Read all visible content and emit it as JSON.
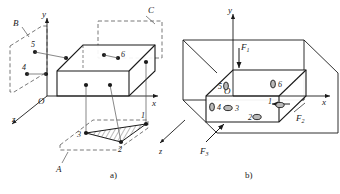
{
  "figure": {
    "caption_a": "a)",
    "caption_b": "b)"
  },
  "panel_a": {
    "name": "Locating scheme with reference planes",
    "axes": {
      "y": "y",
      "x": "x",
      "z": "z",
      "origin": "O"
    },
    "plane_labels": [
      {
        "id": "A",
        "label": "A",
        "note": "bottom dashed plane carrying points 1, 2, 3"
      },
      {
        "id": "B",
        "label": "B",
        "note": "left dashed plane carrying points 4, 5"
      },
      {
        "id": "C",
        "label": "C",
        "note": "rear dashed plane carrying point 6"
      }
    ],
    "points": [
      {
        "id": "1",
        "label": "1"
      },
      {
        "id": "2",
        "label": "2"
      },
      {
        "id": "3",
        "label": "3"
      },
      {
        "id": "4",
        "label": "4"
      },
      {
        "id": "5",
        "label": "5"
      },
      {
        "id": "6",
        "label": "6"
      }
    ]
  },
  "panel_b": {
    "name": "Block with applied forces",
    "axes": {
      "y": "y",
      "x": "x",
      "origin": "O"
    },
    "forces": [
      {
        "id": "F1",
        "label": "F",
        "sub": "1",
        "direction": "downward along -y"
      },
      {
        "id": "F2",
        "label": "F",
        "sub": "2",
        "direction": "toward -x on right face"
      },
      {
        "id": "F3",
        "label": "F",
        "sub": "3",
        "direction": "toward +z on front face"
      }
    ],
    "points": [
      {
        "id": "1",
        "label": "1"
      },
      {
        "id": "2",
        "label": "2"
      },
      {
        "id": "3",
        "label": "3"
      },
      {
        "id": "4",
        "label": "4"
      },
      {
        "id": "5",
        "label": "5"
      },
      {
        "id": "6",
        "label": "6"
      }
    ]
  },
  "style": {
    "line_color": "#1a1a1a",
    "dash_color": "#555555",
    "fill_color": "#ffffff"
  }
}
